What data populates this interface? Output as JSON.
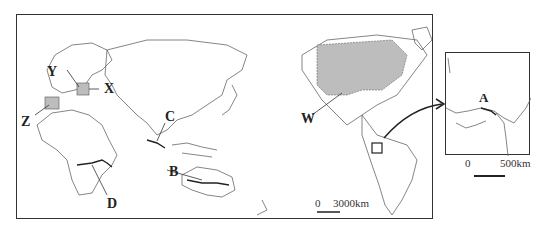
{
  "main_map": {
    "labels": {
      "Y": "Y",
      "X": "X",
      "Z": "Z",
      "C": "C",
      "D": "D",
      "B": "B",
      "W": "W"
    },
    "scale": {
      "zero": "0",
      "distance": "3000km"
    },
    "shaded_regions": [
      "W (Canada)",
      "X (Germany)",
      "Z (Spain)"
    ],
    "colors": {
      "shade": "#bdbdbd",
      "outline": "#555555",
      "frame": "#333333"
    }
  },
  "inset_map": {
    "label": "A",
    "scale": {
      "zero": "0",
      "distance": "500km"
    }
  }
}
